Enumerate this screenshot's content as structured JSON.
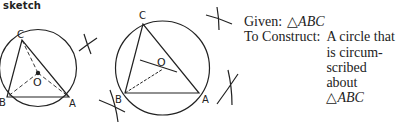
{
  "header": {
    "label": "sketch"
  },
  "figures": {
    "left": {
      "points": {
        "A": "A",
        "B": "B",
        "C": "C",
        "O": "O"
      }
    },
    "right": {
      "points": {
        "A": "A",
        "B": "B",
        "C": "C",
        "O": "O"
      }
    }
  },
  "text": {
    "given_label": "Given:",
    "given_triangle_symbol": "△",
    "given_value": "ABC",
    "construct_label": "To Construct:",
    "construct_lines": [
      "A circle that",
      "is circum-",
      "scribed",
      "about"
    ],
    "construct_triangle_symbol": "△",
    "construct_value": "ABC"
  },
  "colors": {
    "ink": "#222222",
    "background": "#ffffff"
  }
}
